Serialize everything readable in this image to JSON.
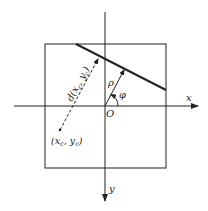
{
  "diagram": {
    "axes": {
      "x_label": "x",
      "y_label": "y",
      "origin_label": "O"
    },
    "line_params": {
      "rho_label": "ρ",
      "phi_label": "φ"
    },
    "point": {
      "label": "(x",
      "label_sub_x": "c",
      "label_mid": ", y",
      "label_sub_y": "c",
      "label_end": ")"
    },
    "distance": {
      "label": "d(x",
      "label_sub_x": "c",
      "label_mid": ", y",
      "label_sub_y": "c",
      "label_end": ")"
    },
    "colors": {
      "stroke": "#222222",
      "background": "#ffffff"
    }
  }
}
